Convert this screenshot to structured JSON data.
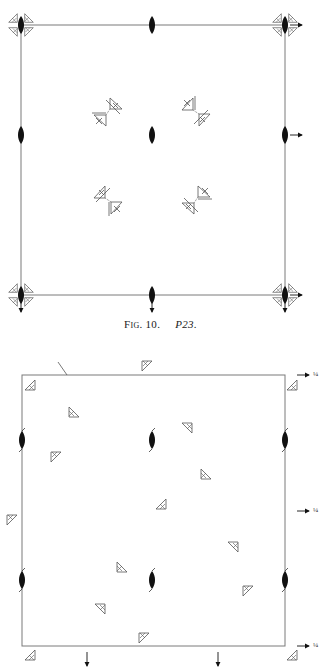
{
  "colors": {
    "line": "#7a7a7a",
    "ink": "#111111",
    "symbol": "#555555",
    "background": "#ffffff"
  },
  "figure1": {
    "caption_prefix": "Fig. 10.",
    "caption_name": "P23.",
    "frame": {
      "x1": 21,
      "y1": 25,
      "x2": 285,
      "y2": 295
    },
    "twofold_axes": [
      {
        "x": 21,
        "y": 25
      },
      {
        "x": 152,
        "y": 25
      },
      {
        "x": 285,
        "y": 25
      },
      {
        "x": 21,
        "y": 135
      },
      {
        "x": 152,
        "y": 135
      },
      {
        "x": 285,
        "y": 135
      },
      {
        "x": 21,
        "y": 295
      },
      {
        "x": 152,
        "y": 295
      },
      {
        "x": 285,
        "y": 295
      }
    ],
    "corner_clusters": [
      {
        "x": 21,
        "y": 25
      },
      {
        "x": 285,
        "y": 25
      },
      {
        "x": 21,
        "y": 295
      },
      {
        "x": 285,
        "y": 295
      }
    ],
    "threefold_pairs": [
      {
        "x": 108,
        "y": 112,
        "orient": "nw"
      },
      {
        "x": 196,
        "y": 112,
        "orient": "ne"
      },
      {
        "x": 108,
        "y": 200,
        "orient": "sw"
      },
      {
        "x": 196,
        "y": 200,
        "orient": "se"
      }
    ],
    "arrows_right": [
      {
        "x": 290,
        "y": 25
      },
      {
        "x": 290,
        "y": 135
      },
      {
        "x": 290,
        "y": 295
      }
    ],
    "arrows_down": [
      {
        "x": 21,
        "y": 300
      },
      {
        "x": 152,
        "y": 300
      },
      {
        "x": 285,
        "y": 300
      }
    ]
  },
  "figure2": {
    "frame": {
      "x1": 22,
      "y1": 375,
      "x2": 285,
      "y2": 646
    },
    "quarter_label": "¼",
    "twofold_screw": [
      {
        "x": 22,
        "y": 440
      },
      {
        "x": 152,
        "y": 440
      },
      {
        "x": 285,
        "y": 440
      },
      {
        "x": 22,
        "y": 580
      },
      {
        "x": 152,
        "y": 580
      },
      {
        "x": 285,
        "y": 580
      }
    ],
    "triangles": [
      {
        "x": 30,
        "y": 385,
        "rot": 0
      },
      {
        "x": 147,
        "y": 366,
        "rot": 180
      },
      {
        "x": 292,
        "y": 385,
        "rot": 0
      },
      {
        "x": 74,
        "y": 412,
        "rot": 90
      },
      {
        "x": 187,
        "y": 428,
        "rot": 270
      },
      {
        "x": 56,
        "y": 457,
        "rot": 180
      },
      {
        "x": 206,
        "y": 474,
        "rot": 90
      },
      {
        "x": 161,
        "y": 504,
        "rot": 0
      },
      {
        "x": 12,
        "y": 520,
        "rot": 180
      },
      {
        "x": 233,
        "y": 547,
        "rot": 270
      },
      {
        "x": 122,
        "y": 567,
        "rot": 90
      },
      {
        "x": 248,
        "y": 591,
        "rot": 180
      },
      {
        "x": 100,
        "y": 609,
        "rot": 270
      },
      {
        "x": 144,
        "y": 638,
        "rot": 180
      },
      {
        "x": 30,
        "y": 655,
        "rot": 0
      },
      {
        "x": 292,
        "y": 655,
        "rot": 0
      }
    ],
    "diagonal_tick": {
      "x1": 58,
      "y1": 362,
      "x2": 67,
      "y2": 375
    },
    "arrows_right_quarter": [
      {
        "x": 297,
        "y": 375
      },
      {
        "x": 297,
        "y": 511
      },
      {
        "x": 297,
        "y": 646
      }
    ],
    "arrows_down": [
      {
        "x": 87,
        "y": 652
      },
      {
        "x": 218,
        "y": 652
      }
    ]
  }
}
